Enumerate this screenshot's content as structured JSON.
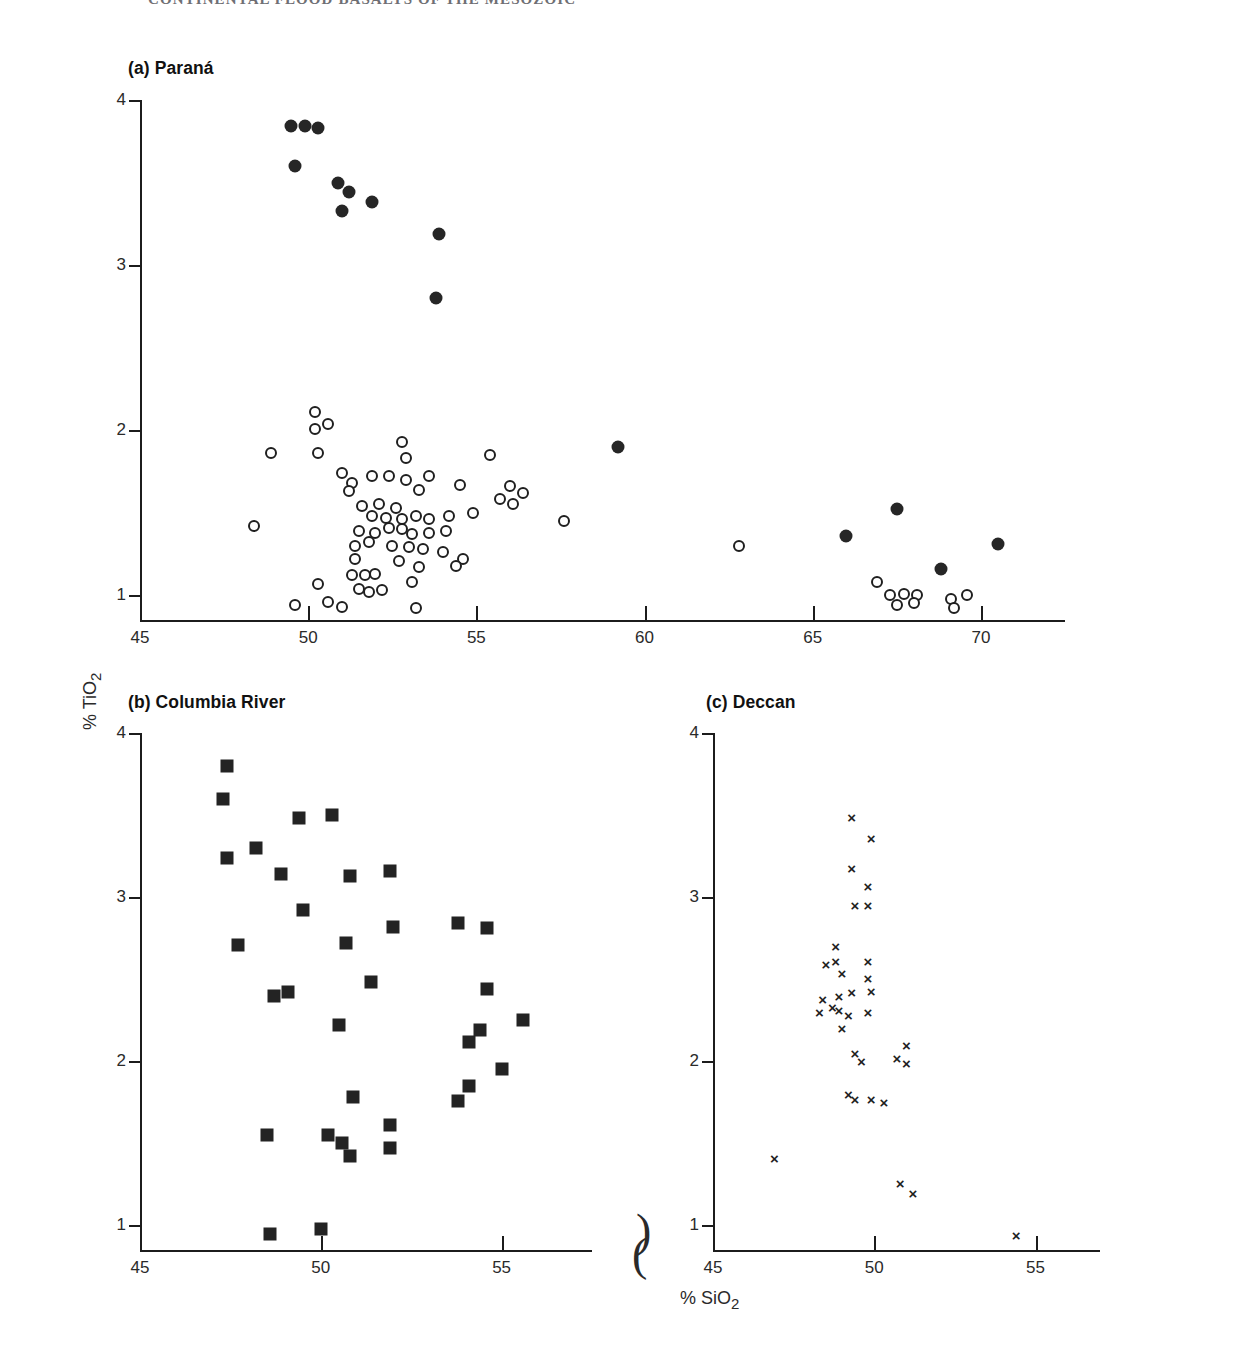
{
  "header": {
    "running_title": "CONTINENTAL FLOOD BASALTS OF THE MESOZOIC"
  },
  "figure": {
    "axis_titles": {
      "x": "% SiO2",
      "x_sub": "2",
      "x_main": "% SiO",
      "y_main": "% TiO",
      "y_sub": "2",
      "y": "% TiO2"
    }
  },
  "chart_data": [
    {
      "type": "scatter",
      "panel": "a",
      "title": "(a) Paraná",
      "xlabel": "% SiO2",
      "ylabel": "% TiO2",
      "xlim": [
        45,
        72.5
      ],
      "ylim": [
        0.85,
        4.0
      ],
      "xticks": [
        45,
        50,
        55,
        60,
        65,
        70
      ],
      "yticks": [
        1,
        2,
        3,
        4
      ],
      "grid": false,
      "legend": "none",
      "series": [
        {
          "name": "high-TiO2 basalt (filled circle)",
          "marker": "filled-circle",
          "points": [
            [
              49.5,
              3.84
            ],
            [
              49.9,
              3.84
            ],
            [
              50.3,
              3.83
            ],
            [
              49.6,
              3.6
            ],
            [
              50.9,
              3.5
            ],
            [
              51.2,
              3.44
            ],
            [
              51.0,
              3.33
            ],
            [
              51.9,
              3.38
            ],
            [
              53.9,
              3.19
            ],
            [
              53.8,
              2.8
            ],
            [
              59.2,
              1.9
            ],
            [
              67.5,
              1.52
            ],
            [
              66.0,
              1.36
            ],
            [
              68.8,
              1.16
            ],
            [
              70.5,
              1.31
            ]
          ]
        },
        {
          "name": "low-TiO2 basalt (open circle)",
          "marker": "open-circle",
          "points": [
            [
              50.2,
              2.11
            ],
            [
              50.2,
              2.01
            ],
            [
              50.6,
              2.04
            ],
            [
              48.9,
              1.86
            ],
            [
              50.3,
              1.86
            ],
            [
              52.8,
              1.93
            ],
            [
              52.9,
              1.83
            ],
            [
              55.4,
              1.85
            ],
            [
              51.0,
              1.74
            ],
            [
              51.3,
              1.68
            ],
            [
              51.9,
              1.72
            ],
            [
              52.4,
              1.72
            ],
            [
              52.9,
              1.7
            ],
            [
              53.6,
              1.72
            ],
            [
              54.5,
              1.67
            ],
            [
              51.2,
              1.63
            ],
            [
              53.3,
              1.64
            ],
            [
              56.0,
              1.66
            ],
            [
              56.4,
              1.62
            ],
            [
              48.4,
              1.42
            ],
            [
              51.6,
              1.54
            ],
            [
              52.1,
              1.55
            ],
            [
              52.6,
              1.53
            ],
            [
              55.7,
              1.58
            ],
            [
              56.1,
              1.55
            ],
            [
              51.9,
              1.48
            ],
            [
              52.3,
              1.47
            ],
            [
              52.8,
              1.46
            ],
            [
              53.2,
              1.48
            ],
            [
              53.6,
              1.46
            ],
            [
              54.2,
              1.48
            ],
            [
              54.9,
              1.5
            ],
            [
              57.6,
              1.45
            ],
            [
              62.8,
              1.3
            ],
            [
              51.5,
              1.39
            ],
            [
              52.0,
              1.38
            ],
            [
              52.4,
              1.41
            ],
            [
              52.8,
              1.4
            ],
            [
              53.1,
              1.37
            ],
            [
              53.6,
              1.38
            ],
            [
              54.1,
              1.39
            ],
            [
              51.4,
              1.3
            ],
            [
              51.8,
              1.32
            ],
            [
              52.5,
              1.3
            ],
            [
              53.0,
              1.29
            ],
            [
              53.4,
              1.28
            ],
            [
              54.0,
              1.26
            ],
            [
              54.6,
              1.22
            ],
            [
              51.4,
              1.22
            ],
            [
              52.7,
              1.21
            ],
            [
              53.3,
              1.17
            ],
            [
              54.4,
              1.18
            ],
            [
              51.3,
              1.12
            ],
            [
              51.7,
              1.12
            ],
            [
              52.0,
              1.13
            ],
            [
              53.1,
              1.08
            ],
            [
              50.3,
              1.07
            ],
            [
              51.5,
              1.04
            ],
            [
              51.8,
              1.02
            ],
            [
              52.2,
              1.03
            ],
            [
              49.6,
              0.94
            ],
            [
              50.6,
              0.96
            ],
            [
              51.0,
              0.93
            ],
            [
              53.2,
              0.92
            ],
            [
              66.9,
              1.08
            ],
            [
              67.3,
              1.0
            ],
            [
              67.7,
              1.01
            ],
            [
              68.1,
              1.0
            ],
            [
              67.5,
              0.94
            ],
            [
              68.0,
              0.95
            ],
            [
              69.1,
              0.98
            ],
            [
              69.6,
              1.0
            ],
            [
              69.2,
              0.92
            ]
          ]
        }
      ]
    },
    {
      "type": "scatter",
      "panel": "b",
      "title": "(b) Columbia River",
      "xlabel": "% SiO2",
      "ylabel": "% TiO2",
      "xlim": [
        45,
        57.5
      ],
      "ylim": [
        0.85,
        4.0
      ],
      "xticks": [
        45,
        50,
        55
      ],
      "yticks": [
        1,
        2,
        3,
        4
      ],
      "grid": false,
      "legend": "none",
      "series": [
        {
          "name": "Columbia River basalt (filled square)",
          "marker": "filled-square",
          "points": [
            [
              47.4,
              3.8
            ],
            [
              47.3,
              3.6
            ],
            [
              47.4,
              3.24
            ],
            [
              48.2,
              3.3
            ],
            [
              49.4,
              3.48
            ],
            [
              50.3,
              3.5
            ],
            [
              48.9,
              3.14
            ],
            [
              50.8,
              3.13
            ],
            [
              51.9,
              3.16
            ],
            [
              49.5,
              2.92
            ],
            [
              47.7,
              2.71
            ],
            [
              50.7,
              2.72
            ],
            [
              52.0,
              2.82
            ],
            [
              53.8,
              2.84
            ],
            [
              54.6,
              2.81
            ],
            [
              48.7,
              2.4
            ],
            [
              49.1,
              2.42
            ],
            [
              51.4,
              2.48
            ],
            [
              54.6,
              2.44
            ],
            [
              50.5,
              2.22
            ],
            [
              54.1,
              2.12
            ],
            [
              54.4,
              2.19
            ],
            [
              55.6,
              2.25
            ],
            [
              55.0,
              1.95
            ],
            [
              53.8,
              1.76
            ],
            [
              54.1,
              1.85
            ],
            [
              50.9,
              1.78
            ],
            [
              51.9,
              1.61
            ],
            [
              48.5,
              1.55
            ],
            [
              50.2,
              1.55
            ],
            [
              50.6,
              1.5
            ],
            [
              50.8,
              1.42
            ],
            [
              51.9,
              1.47
            ],
            [
              48.6,
              0.95
            ],
            [
              50.0,
              0.98
            ]
          ]
        }
      ]
    },
    {
      "type": "scatter",
      "panel": "c",
      "title": "(c) Deccan",
      "xlabel": "% SiO2",
      "ylabel": "% TiO2",
      "xlim": [
        45,
        57
      ],
      "ylim": [
        0.85,
        4.0
      ],
      "xticks": [
        45,
        50,
        55
      ],
      "yticks": [
        1,
        2,
        3,
        4
      ],
      "grid": false,
      "legend": "none",
      "series": [
        {
          "name": "Deccan basalt (cross)",
          "marker": "cross",
          "points": [
            [
              49.3,
              3.49
            ],
            [
              49.9,
              3.36
            ],
            [
              49.3,
              3.18
            ],
            [
              49.8,
              3.07
            ],
            [
              49.4,
              2.95
            ],
            [
              49.8,
              2.95
            ],
            [
              48.8,
              2.7
            ],
            [
              48.5,
              2.59
            ],
            [
              48.8,
              2.61
            ],
            [
              49.0,
              2.54
            ],
            [
              49.8,
              2.61
            ],
            [
              49.8,
              2.51
            ],
            [
              48.4,
              2.38
            ],
            [
              48.9,
              2.4
            ],
            [
              49.3,
              2.42
            ],
            [
              49.9,
              2.43
            ],
            [
              48.3,
              2.3
            ],
            [
              48.7,
              2.33
            ],
            [
              48.9,
              2.31
            ],
            [
              49.2,
              2.28
            ],
            [
              49.8,
              2.3
            ],
            [
              49.0,
              2.2
            ],
            [
              49.4,
              2.05
            ],
            [
              49.6,
              2.0
            ],
            [
              50.7,
              2.02
            ],
            [
              51.0,
              2.1
            ],
            [
              51.0,
              1.99
            ],
            [
              49.2,
              1.8
            ],
            [
              49.4,
              1.77
            ],
            [
              49.9,
              1.77
            ],
            [
              50.3,
              1.75
            ],
            [
              46.9,
              1.41
            ],
            [
              50.8,
              1.26
            ],
            [
              51.2,
              1.2
            ],
            [
              54.4,
              0.94
            ]
          ]
        }
      ]
    }
  ]
}
